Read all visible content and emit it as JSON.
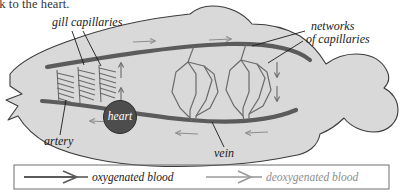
{
  "page": {
    "truncated_caption": "ack to the heart.",
    "background_color": "#ffffff"
  },
  "colors": {
    "body_fill": "#d9d9d9",
    "body_stroke": "#3c3c3c",
    "vessel_dark": "#5b5b5b",
    "vessel_light": "#9a9a9a",
    "heart_fill": "#4d4d4d",
    "heart_text": "#ffffff",
    "label_text": "#1a1a1a",
    "deox_text": "#8d8d8d",
    "legend_border": "#6e6e6e"
  },
  "diagram": {
    "labels": [
      {
        "id": "gill-capillaries",
        "text": "gill capillaries",
        "x": 52,
        "y": 22
      },
      {
        "id": "networks-of-capillaries-line1",
        "text": "networks",
        "x": 311,
        "y": 26
      },
      {
        "id": "networks-of-capillaries-line2",
        "text": "of capillaries",
        "x": 306,
        "y": 39
      },
      {
        "id": "artery",
        "text": "artery",
        "x": 46,
        "y": 140
      },
      {
        "id": "vein",
        "text": "vein",
        "x": 216,
        "y": 152
      },
      {
        "id": "heart",
        "text": "heart",
        "x": 138,
        "y": 115
      }
    ]
  },
  "legend": {
    "items": [
      {
        "id": "oxygenated",
        "label": "oxygenated blood",
        "arrow_color": "#5b5b5b",
        "text_color": "#1a1a1a"
      },
      {
        "id": "deoxygenated",
        "label": "deoxygenated blood",
        "arrow_color": "#9a9a9a",
        "text_color": "#8d8d8d"
      }
    ]
  }
}
